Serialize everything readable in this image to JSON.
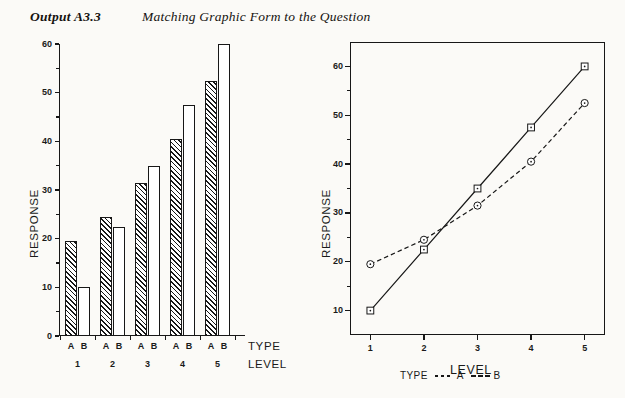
{
  "header": {
    "output_label": "Output A3.3",
    "title": "Matching Graphic Form to the Question"
  },
  "colors": {
    "ink": "#171717",
    "page_background": "#fbfaf7"
  },
  "chart_data": [
    {
      "type": "bar",
      "title": "",
      "xlabel": "LEVEL",
      "ylabel": "RESPONSE",
      "group_axis_label": "TYPE",
      "categories": [
        "1",
        "2",
        "3",
        "4",
        "5"
      ],
      "group_labels": [
        "A",
        "B"
      ],
      "series": [
        {
          "name": "A",
          "fill": "hatched",
          "values": [
            19.5,
            24.5,
            31.5,
            40.5,
            52.5
          ]
        },
        {
          "name": "B",
          "fill": "white",
          "values": [
            10.0,
            22.5,
            35.0,
            47.5,
            60.0
          ]
        }
      ],
      "ylim": [
        0,
        60
      ],
      "yticks": [
        0,
        10,
        20,
        30,
        40,
        50,
        60
      ],
      "ytick_labels": [
        "0",
        "10",
        "20",
        "30",
        "40",
        "50",
        "60"
      ],
      "minor_yticks": [
        5,
        15,
        25,
        35,
        45,
        55
      ],
      "grid": false,
      "legend": "none"
    },
    {
      "type": "line",
      "title": "",
      "xlabel": "LEVEL",
      "ylabel": "RESPONSE",
      "x": [
        1,
        2,
        3,
        4,
        5
      ],
      "xtick_labels": [
        "1",
        "2",
        "3",
        "4",
        "5"
      ],
      "series": [
        {
          "name": "A",
          "style": "dashed",
          "marker": "circle",
          "values": [
            19.5,
            24.5,
            31.5,
            40.5,
            52.5
          ]
        },
        {
          "name": "B",
          "style": "solid",
          "marker": "square",
          "values": [
            10.0,
            22.5,
            35.0,
            47.5,
            60.0
          ]
        }
      ],
      "ylim": [
        5,
        65
      ],
      "yticks": [
        10,
        20,
        30,
        40,
        50,
        60
      ],
      "ytick_labels": [
        "10",
        "20",
        "30",
        "40",
        "50",
        "60"
      ],
      "minor_yticks": [
        15,
        25,
        35,
        45,
        55
      ],
      "grid": false,
      "legend_position": "below",
      "legend": {
        "title": "TYPE",
        "entries": [
          {
            "label": "A",
            "symbol": "dotted-line-marker"
          },
          {
            "label": "B",
            "symbol": "dashed-line-marker"
          }
        ]
      }
    }
  ]
}
